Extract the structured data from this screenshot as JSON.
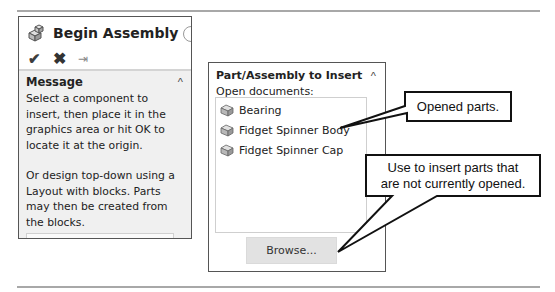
{
  "left_panel": {
    "title": "Begin Assembly",
    "title_icon": "assembly-icon",
    "actions": [
      {
        "name": "ok",
        "glyph": "✔",
        "icon": "checkmark-icon"
      },
      {
        "name": "cancel",
        "glyph": "✖",
        "icon": "close-icon"
      },
      {
        "name": "pin",
        "glyph": "⇥",
        "icon": "pushpin-icon"
      }
    ],
    "message_section": {
      "title": "Message",
      "collapse_glyph": "^",
      "paragraphs": [
        "Select a component to insert, then place it in the graphics area or hit OK to locate it at the origin.",
        "Or design top-down using a Layout with blocks. Parts may then be created from the blocks."
      ],
      "button_label": "Create Layout"
    }
  },
  "right_panel": {
    "title": "Part/Assembly to Insert",
    "collapse_glyph": "^",
    "subtitle": "Open documents:",
    "documents": [
      {
        "label": "Bearing",
        "icon": "part-icon"
      },
      {
        "label": "Fidget Spinner Body",
        "icon": "part-icon"
      },
      {
        "label": "Fidget Spinner Cap",
        "icon": "part-icon"
      }
    ],
    "browse_label": "Browse..."
  },
  "callouts": [
    {
      "text": "Opened parts."
    },
    {
      "line1": "Use to insert parts that",
      "line2": "are not currently opened."
    }
  ]
}
